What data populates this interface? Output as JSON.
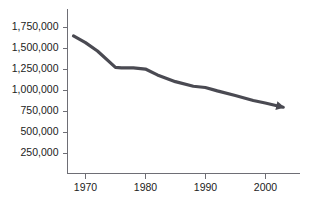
{
  "chart_data": {
    "type": "line",
    "title": "",
    "subtitle": "",
    "xlabel": "",
    "ylabel": "",
    "xlim": [
      1967.0,
      2005.8
    ],
    "ylim": [
      0,
      1875000
    ],
    "grid": false,
    "legend": null,
    "legend_position": "none",
    "line_color": "#4a4a52",
    "axis_color": "#6e6e75",
    "background_color": "#ffffff",
    "line_width": 3.2,
    "arrow_end": true,
    "y_ticks": [
      250000,
      500000,
      750000,
      1000000,
      1250000,
      1500000,
      1750000
    ],
    "y_tick_labels": [
      "250,000",
      "500,000",
      "750,000",
      "1,000,000",
      "1,250,000",
      "1,500,000",
      "1,750,000"
    ],
    "x_ticks": [
      1970,
      1980,
      1990,
      2000
    ],
    "x_tick_labels": [
      "1970",
      "1980",
      "1990",
      "2000"
    ],
    "x": [
      1968,
      1970,
      1972,
      1975,
      1976,
      1978,
      1980,
      1982,
      1985,
      1988,
      1990,
      1992,
      1995,
      1998,
      2000,
      2003
    ],
    "values": [
      1640000,
      1560000,
      1460000,
      1265000,
      1258000,
      1258000,
      1245000,
      1175000,
      1095000,
      1040000,
      1025000,
      985000,
      930000,
      870000,
      840000,
      790000
    ],
    "series": [
      {
        "name": "",
        "values": [
          1640000,
          1560000,
          1460000,
          1265000,
          1258000,
          1258000,
          1245000,
          1175000,
          1095000,
          1040000,
          1025000,
          985000,
          930000,
          870000,
          840000,
          790000
        ]
      }
    ]
  }
}
